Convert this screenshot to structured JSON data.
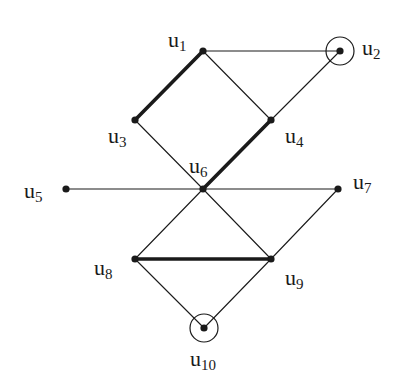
{
  "diagram": {
    "type": "graph",
    "nodes": [
      {
        "id": "u1",
        "label": "u",
        "sub": "1",
        "x": 203,
        "y": 51,
        "lx": 168,
        "ly": 47,
        "circled": false
      },
      {
        "id": "u2",
        "label": "u",
        "sub": "2",
        "x": 340,
        "y": 51,
        "lx": 362,
        "ly": 55,
        "circled": true
      },
      {
        "id": "u3",
        "label": "u",
        "sub": "3",
        "x": 135,
        "y": 120,
        "lx": 108,
        "ly": 143,
        "circled": false
      },
      {
        "id": "u4",
        "label": "u",
        "sub": "4",
        "x": 271,
        "y": 120,
        "lx": 285,
        "ly": 143,
        "circled": false
      },
      {
        "id": "u5",
        "label": "u",
        "sub": "5",
        "x": 66,
        "y": 189,
        "lx": 24,
        "ly": 198,
        "circled": false
      },
      {
        "id": "u6",
        "label": "u",
        "sub": "6",
        "x": 203,
        "y": 189,
        "lx": 189,
        "ly": 173,
        "circled": false
      },
      {
        "id": "u7",
        "label": "u",
        "sub": "7",
        "x": 338,
        "y": 189,
        "lx": 353,
        "ly": 189,
        "circled": false
      },
      {
        "id": "u8",
        "label": "u",
        "sub": "8",
        "x": 135,
        "y": 259,
        "lx": 94,
        "ly": 275,
        "circled": false
      },
      {
        "id": "u9",
        "label": "u",
        "sub": "9",
        "x": 271,
        "y": 259,
        "lx": 285,
        "ly": 285,
        "circled": false
      },
      {
        "id": "u10",
        "label": "u",
        "sub": "10",
        "x": 204,
        "y": 328,
        "lx": 190,
        "ly": 366,
        "circled": true
      }
    ],
    "edges": [
      {
        "from": "u1",
        "to": "u2",
        "bold": false
      },
      {
        "from": "u1",
        "to": "u3",
        "bold": true
      },
      {
        "from": "u1",
        "to": "u4",
        "bold": false
      },
      {
        "from": "u2",
        "to": "u4",
        "bold": false
      },
      {
        "from": "u3",
        "to": "u6",
        "bold": false
      },
      {
        "from": "u4",
        "to": "u6",
        "bold": true
      },
      {
        "from": "u5",
        "to": "u6",
        "bold": false
      },
      {
        "from": "u6",
        "to": "u7",
        "bold": false
      },
      {
        "from": "u6",
        "to": "u8",
        "bold": false
      },
      {
        "from": "u6",
        "to": "u9",
        "bold": false
      },
      {
        "from": "u7",
        "to": "u9",
        "bold": false
      },
      {
        "from": "u8",
        "to": "u9",
        "bold": true
      },
      {
        "from": "u8",
        "to": "u10",
        "bold": false
      },
      {
        "from": "u9",
        "to": "u10",
        "bold": false
      }
    ],
    "colors": {
      "stroke": "#1a1a1a",
      "background": "#ffffff"
    }
  }
}
